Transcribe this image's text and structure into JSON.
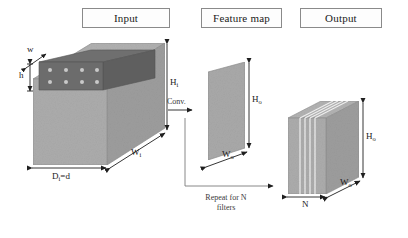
{
  "figure": {
    "type": "diagram",
    "background_color": "#ffffff",
    "volume_fill": "#a9a9a9",
    "filter_fill": "#6e6e6e",
    "stroke_color": "#2b2b2b"
  },
  "stage_titles": {
    "input": "Input",
    "feature_map": "Feature map",
    "output": "Output"
  },
  "input_block": {
    "height_label": "H",
    "height_sub": "i",
    "width_label": "W",
    "width_sub": "i",
    "depth_label": "D",
    "depth_sub": "i",
    "depth_value": "=d",
    "depth_full": "Dᵢ=d",
    "filter_width_label": "w",
    "filter_height_label": "h",
    "filter_dot_columns": 4,
    "filter_dot_rows": 2
  },
  "feature_map_block": {
    "height_label": "H",
    "height_sub": "o",
    "width_label": "W",
    "width_sub": "o"
  },
  "output_block": {
    "height_label": "H",
    "height_sub": "o",
    "width_label": "W",
    "width_sub": "o",
    "count_label": "N",
    "slice_count": 5
  },
  "arrows": {
    "conv_label": "Conv.",
    "repeat_label_line1": "Repeat for N",
    "repeat_label_line2": "filters"
  }
}
